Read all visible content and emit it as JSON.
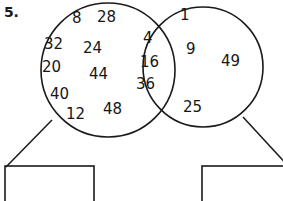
{
  "worksheet": {
    "question_number": "5.",
    "diagram_type": "venn-diagram",
    "stroke_color": "#1a1a1a",
    "background_color": "#ffffff"
  },
  "venn": {
    "left_circle": {
      "label": "left-set",
      "numbers": [
        {
          "value": "8",
          "x": 72,
          "y": 11
        },
        {
          "value": "28",
          "x": 97,
          "y": 10
        },
        {
          "value": "32",
          "x": 44,
          "y": 37
        },
        {
          "value": "24",
          "x": 83,
          "y": 41
        },
        {
          "value": "20",
          "x": 42,
          "y": 60
        },
        {
          "value": "44",
          "x": 89,
          "y": 67
        },
        {
          "value": "40",
          "x": 50,
          "y": 87
        },
        {
          "value": "12",
          "x": 66,
          "y": 107
        },
        {
          "value": "48",
          "x": 103,
          "y": 102
        }
      ]
    },
    "intersection": {
      "label": "intersection-set",
      "numbers": [
        {
          "value": "4",
          "x": 143,
          "y": 31
        },
        {
          "value": "16",
          "x": 140,
          "y": 55
        },
        {
          "value": "36",
          "x": 136,
          "y": 77
        }
      ]
    },
    "right_circle": {
      "label": "right-set",
      "numbers": [
        {
          "value": "1",
          "x": 180,
          "y": 8
        },
        {
          "value": "9",
          "x": 186,
          "y": 42
        },
        {
          "value": "49",
          "x": 221,
          "y": 54
        },
        {
          "value": "25",
          "x": 183,
          "y": 100
        }
      ]
    }
  },
  "answer_boxes": [
    {
      "name": "left-answer-box",
      "value": "",
      "x": 5,
      "y": 166,
      "width": 89,
      "height": 42
    },
    {
      "name": "right-answer-box",
      "value": "",
      "x": 202,
      "y": 166,
      "width": 89,
      "height": 42
    }
  ]
}
